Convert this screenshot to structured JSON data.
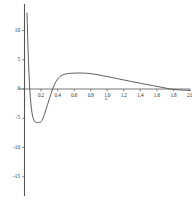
{
  "chart_data": {
    "type": "line",
    "title": "",
    "xlabel": "x",
    "ylabel": "",
    "xlim": [
      -0.02,
      2.05
    ],
    "ylim": [
      -17.2,
      13.0
    ],
    "grid": false,
    "legend": null,
    "xticks": [
      0.2,
      0.4,
      0.6,
      0.8,
      1.0,
      1.2,
      1.4,
      1.6,
      1.8,
      2.0
    ],
    "xtick_labels": [
      "0.2",
      "0.4",
      "0.6",
      "0.8",
      "1.0",
      "1.2",
      "1.4",
      "1.6",
      "1.8",
      "2.0"
    ],
    "yticks": [
      10,
      5,
      0,
      -5,
      -10,
      -15
    ],
    "ytick_labels": [
      "10",
      "5",
      "0",
      "-5",
      "-10",
      "-15"
    ],
    "line_color": "#4d4d4d",
    "axis_color": "#555555",
    "background_color": "#ffffff",
    "features": {
      "vertical_asymptote_x": 0.03,
      "minimum": {
        "x": 0.19,
        "y": -5.7
      },
      "zero_crossing_rising": 0.34,
      "maximum": {
        "x": 0.72,
        "y": 2.7
      },
      "zero_crossing_falling": 1.75,
      "value_at_right_edge": -0.25
    },
    "series": [
      {
        "name": "curve",
        "x": [
          0.03,
          0.034,
          0.038,
          0.043,
          0.048,
          0.055,
          0.062,
          0.07,
          0.08,
          0.09,
          0.1,
          0.11,
          0.12,
          0.13,
          0.14,
          0.15,
          0.16,
          0.17,
          0.18,
          0.19,
          0.2,
          0.21,
          0.22,
          0.23,
          0.24,
          0.26,
          0.28,
          0.3,
          0.32,
          0.34,
          0.36,
          0.38,
          0.4,
          0.43,
          0.46,
          0.5,
          0.54,
          0.58,
          0.62,
          0.66,
          0.7,
          0.72,
          0.76,
          0.8,
          0.85,
          0.9,
          0.95,
          1.0,
          1.06,
          1.12,
          1.18,
          1.25,
          1.32,
          1.4,
          1.48,
          1.56,
          1.64,
          1.72,
          1.75,
          1.8,
          1.86,
          1.92,
          2.0
        ],
        "y": [
          13.0,
          11.2,
          9.1,
          6.8,
          4.7,
          2.3,
          0.4,
          -1.3,
          -2.9,
          -4.0,
          -4.75,
          -5.2,
          -5.48,
          -5.64,
          -5.72,
          -5.75,
          -5.74,
          -5.72,
          -5.71,
          -5.7,
          -5.6,
          -5.4,
          -5.1,
          -4.75,
          -4.35,
          -3.5,
          -2.6,
          -1.7,
          -0.8,
          0.0,
          0.7,
          1.25,
          1.7,
          2.15,
          2.4,
          2.58,
          2.66,
          2.7,
          2.72,
          2.73,
          2.73,
          2.72,
          2.68,
          2.62,
          2.52,
          2.4,
          2.26,
          2.12,
          1.95,
          1.78,
          1.6,
          1.4,
          1.2,
          0.98,
          0.76,
          0.55,
          0.34,
          0.12,
          0.02,
          -0.06,
          -0.14,
          -0.2,
          -0.25
        ]
      }
    ]
  },
  "axes": {
    "x_title": "x"
  }
}
